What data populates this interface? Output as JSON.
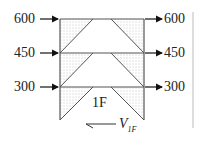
{
  "diagram": {
    "left_loads": [
      {
        "label": "600",
        "y": 19
      },
      {
        "label": "450",
        "y": 53
      },
      {
        "label": "300",
        "y": 87
      }
    ],
    "right_loads": [
      {
        "label": "600",
        "y": 19
      },
      {
        "label": "450",
        "y": 53
      },
      {
        "label": "300",
        "y": 87
      }
    ],
    "floor_label": "1F",
    "shear_label": "V",
    "shear_subscript": "1F",
    "colors": {
      "line": "#555555",
      "text": "#222222",
      "hatch": "#888888"
    }
  }
}
